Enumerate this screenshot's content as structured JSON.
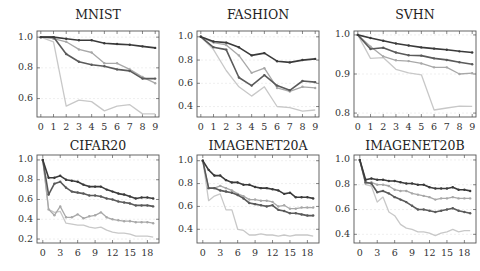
{
  "chart_data": [
    {
      "type": "line",
      "title": "MNIST",
      "xlabel": "",
      "ylabel": "",
      "x": [
        0,
        1,
        2,
        3,
        4,
        5,
        6,
        7,
        8,
        9
      ],
      "xticks": [
        0,
        1,
        2,
        3,
        4,
        5,
        6,
        7,
        8,
        9
      ],
      "yticks": [
        0.6,
        0.8,
        1.0
      ],
      "ylim": [
        0.48,
        1.04
      ],
      "xlim": [
        -0.3,
        9.3
      ],
      "grid": true,
      "legend": "none",
      "series": [
        {
          "name": "series-1",
          "color": "#3a3a3a",
          "markers": true,
          "values": [
            1.0,
            1.0,
            0.99,
            0.98,
            0.98,
            0.96,
            0.955,
            0.95,
            0.94,
            0.93
          ]
        },
        {
          "name": "series-2",
          "color": "#5a5a5a",
          "markers": true,
          "values": [
            1.0,
            1.0,
            0.89,
            0.84,
            0.82,
            0.81,
            0.79,
            0.78,
            0.73,
            0.73
          ]
        },
        {
          "name": "series-3",
          "color": "#a8a8a8",
          "markers": true,
          "values": [
            1.0,
            0.99,
            0.97,
            0.92,
            0.9,
            0.83,
            0.83,
            0.79,
            0.74,
            0.7
          ]
        },
        {
          "name": "series-4",
          "color": "#c8c8c8",
          "markers": false,
          "values": [
            1.0,
            0.97,
            0.55,
            0.59,
            0.58,
            0.52,
            0.55,
            0.56,
            0.5,
            0.5
          ]
        }
      ]
    },
    {
      "type": "line",
      "title": "FASHION",
      "xlabel": "",
      "ylabel": "",
      "x": [
        0,
        1,
        2,
        3,
        4,
        5,
        6,
        7,
        8,
        9
      ],
      "xticks": [
        0,
        1,
        2,
        3,
        4,
        5,
        6,
        7,
        8,
        9
      ],
      "yticks": [
        0.4,
        0.6,
        0.8,
        1.0
      ],
      "ylim": [
        0.31,
        1.05
      ],
      "xlim": [
        -0.3,
        9.3
      ],
      "grid": true,
      "legend": "none",
      "series": [
        {
          "name": "series-1",
          "color": "#3a3a3a",
          "markers": true,
          "values": [
            1.0,
            0.96,
            0.95,
            0.91,
            0.84,
            0.86,
            0.79,
            0.78,
            0.8,
            0.81
          ]
        },
        {
          "name": "series-2",
          "color": "#5a5a5a",
          "markers": true,
          "values": [
            1.0,
            0.91,
            0.89,
            0.65,
            0.58,
            0.67,
            0.58,
            0.54,
            0.62,
            0.61
          ]
        },
        {
          "name": "series-3",
          "color": "#a8a8a8",
          "markers": true,
          "values": [
            1.0,
            0.95,
            0.93,
            0.84,
            0.69,
            0.73,
            0.56,
            0.53,
            0.57,
            0.56
          ]
        },
        {
          "name": "series-4",
          "color": "#c8c8c8",
          "markers": false,
          "values": [
            1.0,
            0.89,
            0.71,
            0.57,
            0.49,
            0.57,
            0.4,
            0.39,
            0.36,
            0.37
          ]
        }
      ]
    },
    {
      "type": "line",
      "title": "SVHN",
      "xlabel": "",
      "ylabel": "",
      "x": [
        0,
        1,
        2,
        3,
        4,
        5,
        6,
        7,
        8,
        9
      ],
      "xticks": [
        0,
        1,
        2,
        3,
        4,
        5,
        6,
        7,
        8,
        9
      ],
      "yticks": [
        0.8,
        0.9,
        1.0
      ],
      "ylim": [
        0.79,
        1.01
      ],
      "xlim": [
        -0.3,
        9.3
      ],
      "grid": true,
      "legend": "none",
      "series": [
        {
          "name": "series-1",
          "color": "#3a3a3a",
          "markers": true,
          "values": [
            1.0,
            0.992,
            0.985,
            0.978,
            0.973,
            0.968,
            0.965,
            0.962,
            0.958,
            0.955
          ]
        },
        {
          "name": "series-2",
          "color": "#5a5a5a",
          "markers": true,
          "values": [
            1.0,
            0.964,
            0.967,
            0.955,
            0.948,
            0.947,
            0.94,
            0.936,
            0.93,
            0.925
          ]
        },
        {
          "name": "series-3",
          "color": "#a8a8a8",
          "markers": true,
          "values": [
            1.0,
            0.97,
            0.945,
            0.935,
            0.933,
            0.927,
            0.917,
            0.917,
            0.9,
            0.902
          ]
        },
        {
          "name": "series-4",
          "color": "#c8c8c8",
          "markers": false,
          "values": [
            1.0,
            0.94,
            0.942,
            0.912,
            0.903,
            0.898,
            0.808,
            0.813,
            0.818,
            0.817
          ]
        }
      ]
    },
    {
      "type": "line",
      "title": "CIFAR20",
      "xlabel": "",
      "ylabel": "",
      "x": [
        0,
        1,
        2,
        3,
        4,
        5,
        6,
        7,
        8,
        9,
        10,
        11,
        12,
        13,
        14,
        15,
        16,
        17,
        18,
        19
      ],
      "xticks": [
        0,
        3,
        6,
        9,
        12,
        15,
        18
      ],
      "yticks": [
        0.2,
        0.4,
        0.6,
        0.8,
        1.0
      ],
      "ylim": [
        0.16,
        1.05
      ],
      "xlim": [
        -1,
        20
      ],
      "grid": true,
      "legend": "none",
      "series": [
        {
          "name": "series-1",
          "color": "#3a3a3a",
          "markers": true,
          "values": [
            1.0,
            0.82,
            0.82,
            0.84,
            0.8,
            0.79,
            0.78,
            0.75,
            0.73,
            0.73,
            0.73,
            0.7,
            0.68,
            0.66,
            0.65,
            0.63,
            0.61,
            0.62,
            0.62,
            0.61
          ]
        },
        {
          "name": "series-2",
          "color": "#5a5a5a",
          "markers": true,
          "values": [
            1.0,
            0.65,
            0.76,
            0.78,
            0.72,
            0.68,
            0.67,
            0.66,
            0.64,
            0.64,
            0.63,
            0.61,
            0.6,
            0.58,
            0.57,
            0.56,
            0.54,
            0.54,
            0.54,
            0.53
          ]
        },
        {
          "name": "series-3",
          "color": "#a8a8a8",
          "markers": true,
          "values": [
            1.0,
            0.5,
            0.44,
            0.53,
            0.42,
            0.42,
            0.45,
            0.41,
            0.43,
            0.44,
            0.47,
            0.42,
            0.4,
            0.39,
            0.38,
            0.38,
            0.37,
            0.37,
            0.37,
            0.36
          ]
        },
        {
          "name": "series-4",
          "color": "#c8c8c8",
          "markers": false,
          "values": [
            1.0,
            0.5,
            0.47,
            0.48,
            0.36,
            0.35,
            0.34,
            0.34,
            0.32,
            0.31,
            0.32,
            0.29,
            0.27,
            0.26,
            0.26,
            0.25,
            0.23,
            0.23,
            0.23,
            0.22
          ]
        }
      ]
    },
    {
      "type": "line",
      "title": "IMAGENET20A",
      "xlabel": "",
      "ylabel": "",
      "x": [
        0,
        1,
        2,
        3,
        4,
        5,
        6,
        7,
        8,
        9,
        10,
        11,
        12,
        13,
        14,
        15,
        16,
        17,
        18,
        19
      ],
      "xticks": [
        0,
        3,
        6,
        9,
        12,
        15,
        18
      ],
      "yticks": [
        0.4,
        0.6,
        0.8,
        1.0
      ],
      "ylim": [
        0.28,
        1.05
      ],
      "xlim": [
        -1,
        20
      ],
      "grid": true,
      "legend": "none",
      "series": [
        {
          "name": "series-1",
          "color": "#3a3a3a",
          "markers": true,
          "values": [
            1.0,
            0.92,
            0.87,
            0.87,
            0.83,
            0.81,
            0.81,
            0.79,
            0.79,
            0.77,
            0.76,
            0.76,
            0.75,
            0.74,
            0.71,
            0.72,
            0.68,
            0.68,
            0.68,
            0.67
          ]
        },
        {
          "name": "series-2",
          "color": "#5a5a5a",
          "markers": true,
          "values": [
            1.0,
            0.76,
            0.76,
            0.74,
            0.73,
            0.72,
            0.7,
            0.67,
            0.63,
            0.62,
            0.61,
            0.6,
            0.61,
            0.57,
            0.56,
            0.54,
            0.54,
            0.53,
            0.52,
            0.52
          ]
        },
        {
          "name": "series-3",
          "color": "#a8a8a8",
          "markers": true,
          "values": [
            1.0,
            0.76,
            0.76,
            0.78,
            0.76,
            0.74,
            0.71,
            0.69,
            0.66,
            0.66,
            0.65,
            0.65,
            0.64,
            0.6,
            0.61,
            0.58,
            0.58,
            0.59,
            0.59,
            0.59
          ]
        },
        {
          "name": "series-4",
          "color": "#c8c8c8",
          "markers": false,
          "values": [
            1.0,
            0.65,
            0.69,
            0.71,
            0.57,
            0.57,
            0.4,
            0.39,
            0.35,
            0.35,
            0.36,
            0.35,
            0.35,
            0.34,
            0.35,
            0.34,
            0.35,
            0.35,
            0.35,
            0.34
          ]
        }
      ]
    },
    {
      "type": "line",
      "title": "IMAGENET20B",
      "xlabel": "",
      "ylabel": "",
      "x": [
        0,
        1,
        2,
        3,
        4,
        5,
        6,
        7,
        8,
        9,
        10,
        11,
        12,
        13,
        14,
        15,
        16,
        17,
        18,
        19
      ],
      "xticks": [
        0,
        3,
        6,
        9,
        12,
        15,
        18
      ],
      "yticks": [
        0.4,
        0.6,
        0.8,
        1.0
      ],
      "ylim": [
        0.33,
        1.04
      ],
      "xlim": [
        -1,
        20
      ],
      "grid": true,
      "legend": "none",
      "series": [
        {
          "name": "series-1",
          "color": "#3a3a3a",
          "markers": true,
          "values": [
            1.0,
            0.84,
            0.85,
            0.84,
            0.84,
            0.83,
            0.83,
            0.82,
            0.81,
            0.81,
            0.8,
            0.8,
            0.78,
            0.77,
            0.77,
            0.77,
            0.78,
            0.76,
            0.76,
            0.75
          ]
        },
        {
          "name": "series-2",
          "color": "#5a5a5a",
          "markers": true,
          "values": [
            1.0,
            0.82,
            0.81,
            0.74,
            0.75,
            0.73,
            0.7,
            0.68,
            0.66,
            0.63,
            0.6,
            0.6,
            0.59,
            0.58,
            0.59,
            0.6,
            0.61,
            0.59,
            0.58,
            0.57
          ]
        },
        {
          "name": "series-3",
          "color": "#a8a8a8",
          "markers": true,
          "values": [
            1.0,
            0.81,
            0.82,
            0.8,
            0.8,
            0.79,
            0.76,
            0.75,
            0.75,
            0.73,
            0.72,
            0.71,
            0.7,
            0.68,
            0.69,
            0.69,
            0.7,
            0.69,
            0.69,
            0.69
          ]
        },
        {
          "name": "series-4",
          "color": "#c8c8c8",
          "markers": false,
          "values": [
            1.0,
            0.8,
            0.79,
            0.66,
            0.7,
            0.58,
            0.55,
            0.48,
            0.45,
            0.44,
            0.42,
            0.42,
            0.41,
            0.39,
            0.41,
            0.42,
            0.44,
            0.42,
            0.43,
            0.43
          ]
        }
      ]
    }
  ],
  "layout": {
    "panels": [
      {
        "box": [
          37,
          31,
          122,
          86
        ],
        "title_y": 15
      },
      {
        "box": [
          197,
          31,
          122,
          86
        ],
        "title_y": 15
      },
      {
        "box": [
          354,
          31,
          122,
          86
        ],
        "title_y": 15
      },
      {
        "box": [
          37,
          155,
          122,
          88
        ],
        "title_y": 146
      },
      {
        "box": [
          197,
          155,
          122,
          88
        ],
        "title_y": 146
      },
      {
        "box": [
          354,
          155,
          122,
          88
        ],
        "title_y": 146
      }
    ]
  }
}
